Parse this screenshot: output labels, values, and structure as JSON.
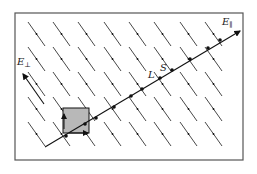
{
  "figure": {
    "frame": {
      "x": 15,
      "y": 13,
      "w": 228,
      "h": 147
    },
    "colors": {
      "line": "#333333",
      "frame": "#555555",
      "square_fill": "#b8b8b8",
      "dot": "#111111"
    },
    "labels": {
      "e_parallel": {
        "main": "E",
        "sub": "∥"
      },
      "e_perp": {
        "main": "E",
        "sub": "⊥"
      },
      "L": "L",
      "S": "S"
    },
    "main_line": {
      "x1": 45,
      "y1": 147,
      "x2": 240,
      "y2": 31
    },
    "dots": [
      [
        66,
        136
      ],
      [
        85,
        124
      ],
      [
        96,
        118
      ],
      [
        114,
        107
      ],
      [
        131,
        96
      ],
      [
        142,
        89
      ],
      [
        160,
        78
      ],
      [
        172,
        70
      ],
      [
        190,
        59
      ],
      [
        208,
        48
      ],
      [
        220,
        40
      ]
    ],
    "square": {
      "x": 63,
      "y": 108,
      "w": 26,
      "h": 25
    }
  }
}
